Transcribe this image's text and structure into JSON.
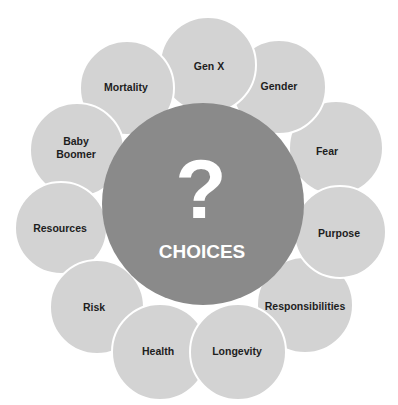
{
  "diagram": {
    "center": {
      "symbol": "?",
      "label": "CHOICES",
      "color": "#8a8a8a"
    },
    "petal_color": "#d3d3d3",
    "outline_color": "#ffffff",
    "petals": [
      {
        "label": "Gen X"
      },
      {
        "label": "Gender"
      },
      {
        "label": "Fear"
      },
      {
        "label": "Purpose"
      },
      {
        "label": "Responsibilities"
      },
      {
        "label": "Longevity"
      },
      {
        "label": "Health"
      },
      {
        "label": "Risk"
      },
      {
        "label": "Resources"
      },
      {
        "label": "Baby",
        "label2": "Boomer"
      },
      {
        "label": "Mortality"
      }
    ]
  }
}
